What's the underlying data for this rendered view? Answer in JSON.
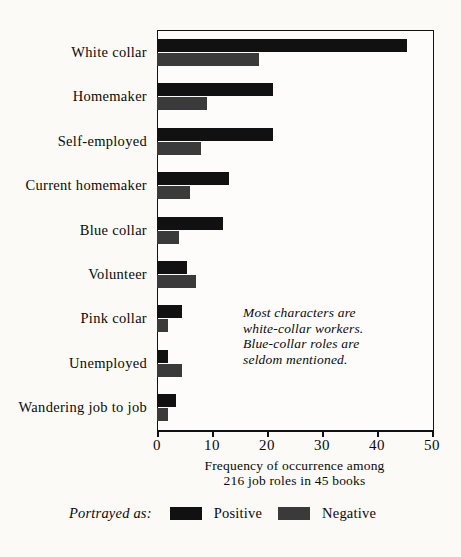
{
  "chart_data": {
    "type": "bar",
    "orientation": "horizontal",
    "title": "",
    "xlabel": "Frequency of occurrence among 216 job roles in 45 books",
    "xlabel_line1": "Frequency of occurrence among",
    "xlabel_line2": "216 job roles in 45 books",
    "ylabel": "",
    "xlim": [
      0,
      50
    ],
    "xticks": [
      0,
      10,
      20,
      30,
      40,
      50
    ],
    "xtick_labels": [
      "0",
      "10",
      "20",
      "30",
      "40",
      "50"
    ],
    "grid": false,
    "legend_position": "bottom",
    "legend_title": "Portrayed as:",
    "categories": [
      "White collar",
      "Homemaker",
      "Self-employed",
      "Current homemaker",
      "Blue collar",
      "Volunteer",
      "Pink collar",
      "Unemployed",
      "Wandering job to job"
    ],
    "series": [
      {
        "name": "Positive",
        "color": "#111111",
        "values": [
          45.5,
          21,
          21,
          13,
          12,
          5.5,
          4.5,
          2,
          3.5
        ]
      },
      {
        "name": "Negative",
        "color": "#3a3a3a",
        "values": [
          18.5,
          9,
          8,
          6,
          4,
          7,
          2,
          4.5,
          2
        ]
      }
    ],
    "annotation": "Most characters are white-collar workers. Blue-collar roles are seldom mentioned.",
    "annotation_lines": [
      "Most characters are",
      "white-collar workers.",
      "Blue-collar roles are",
      "seldom mentioned."
    ]
  },
  "legend": {
    "title": "Portrayed as:",
    "items": [
      {
        "label": "Positive",
        "color": "#111111",
        "swatch_icon": "filled-square-dark-icon"
      },
      {
        "label": "Negative",
        "color": "#3a3a3a",
        "swatch_icon": "filled-square-gray-icon"
      }
    ]
  },
  "colors": {
    "positive": "#111111",
    "negative": "#3a3a3a",
    "axis": "#111111",
    "paper": "#fbfaf7",
    "plot_background": "#fdfcfa"
  }
}
